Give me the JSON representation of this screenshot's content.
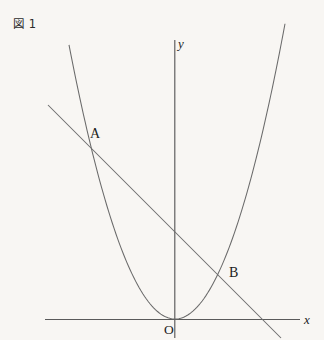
{
  "figure": {
    "caption": "図 1",
    "background_color": "#f8f6f3",
    "ink_color": "#5a5a5a"
  },
  "labels": {
    "x_axis": "x",
    "y_axis": "y",
    "origin": "O",
    "point_a": "A",
    "point_b": "B"
  },
  "chart_data": {
    "type": "line",
    "title": "図 1",
    "xlabel": "x",
    "ylabel": "y",
    "grid": false,
    "legend": "none",
    "axes": {
      "origin_px": [
        175,
        319
      ],
      "x_axis_px": {
        "x1": 45,
        "y1": 319,
        "x2": 300,
        "y2": 319
      },
      "y_axis_px": {
        "x1": 175,
        "y1": 40,
        "x2": 175,
        "y2": 338
      },
      "x_axis_arrow": false,
      "y_axis_arrow": false
    },
    "series": [
      {
        "name": "parabola",
        "kind": "parabola",
        "equation_form": "y = a x^2",
        "vertex_px": [
          175,
          319
        ],
        "a_px": 0.0244,
        "x_domain_px": [
          69,
          285
        ],
        "points_px": [
          [
            69,
            45
          ],
          [
            85,
            92
          ],
          [
            100,
            132
          ],
          [
            115,
            167
          ],
          [
            130,
            215
          ],
          [
            145,
            255
          ],
          [
            160,
            294
          ],
          [
            175,
            319
          ],
          [
            190,
            314
          ],
          [
            205,
            283
          ],
          [
            220,
            239
          ],
          [
            235,
            186
          ],
          [
            250,
            125
          ],
          [
            265,
            87
          ],
          [
            285,
            45
          ]
        ]
      },
      {
        "name": "line",
        "kind": "line",
        "equation_form": "y = m x + c",
        "slope_px": 1.0,
        "points_px": [
          [
            48,
            105
          ],
          [
            281,
            338
          ]
        ],
        "x_intercept_px": [
          268,
          319
        ],
        "y_intercept_px": [
          175,
          232
        ]
      }
    ],
    "annotations": [
      {
        "label": "A",
        "kind": "intersection",
        "at_px": [
          89,
          140
        ],
        "label_px": [
          92,
          136
        ]
      },
      {
        "label": "B",
        "kind": "intersection",
        "at_px": [
          222,
          273
        ],
        "label_px": [
          229,
          273
        ]
      },
      {
        "label": "O",
        "kind": "origin",
        "at_px": [
          175,
          319
        ],
        "label_px": [
          166,
          333
        ]
      },
      {
        "label": "x",
        "kind": "axis-name",
        "at_px": [
          300,
          319
        ],
        "label_px": [
          305,
          322
        ]
      },
      {
        "label": "y",
        "kind": "axis-name",
        "at_px": [
          175,
          40
        ],
        "label_px": [
          178,
          46
        ]
      }
    ]
  }
}
